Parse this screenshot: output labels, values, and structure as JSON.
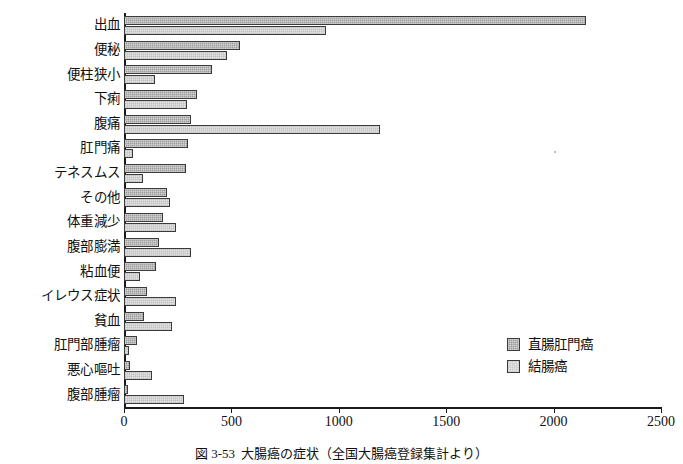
{
  "chart_data": {
    "type": "bar",
    "orientation": "horizontal",
    "title": "",
    "xlabel": "",
    "ylabel": "",
    "xlim": [
      0,
      2500
    ],
    "xticks": [
      0,
      500,
      1000,
      1500,
      2000,
      2500
    ],
    "grid": false,
    "legend_position": "lower-right",
    "categories": [
      "出血",
      "便秘",
      "便柱狭小",
      "下痢",
      "腹痛",
      "肛門痛",
      "テネスムス",
      "その他",
      "体重減少",
      "腹部膨満",
      "粘血便",
      "イレウス症状",
      "貧血",
      "肛門部腫瘤",
      "悪心嘔吐",
      "腹部腫瘤"
    ],
    "series": [
      {
        "name": "直腸肛門癌",
        "color": "#9d9d9d",
        "values": [
          2150,
          540,
          410,
          340,
          310,
          300,
          290,
          200,
          180,
          165,
          150,
          105,
          95,
          60,
          30,
          20
        ]
      },
      {
        "name": "結腸癌",
        "color": "#e2e2e2",
        "values": [
          940,
          480,
          145,
          295,
          1190,
          40,
          90,
          215,
          240,
          310,
          75,
          240,
          225,
          25,
          130,
          280
        ]
      }
    ]
  },
  "legend": {
    "items": [
      {
        "label": "直腸肛門癌",
        "swatch": "dark"
      },
      {
        "label": "結腸癌",
        "swatch": "light"
      }
    ]
  },
  "caption": {
    "number": "図 3-53",
    "text": "大腸癌の症状（全国大腸癌登録集計より）"
  }
}
